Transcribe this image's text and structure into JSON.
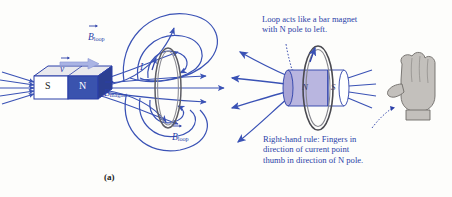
{
  "figure": {
    "background_color": "#fdfdfb",
    "ink_color": "#2b3fa8",
    "field_line_color": "#3a52b5",
    "caption_color": "#1a1a1a"
  },
  "panel_a": {
    "caption": "(a)",
    "magnet": {
      "south_label": "S",
      "north_label": "N",
      "south_face_color": "#ffffff",
      "north_face_color": "#3a53ae",
      "top_face_color": "#e9e9ee",
      "outline_color": "#2b3fa8"
    },
    "velocity": {
      "label": "v",
      "has_vector_arrow": true,
      "arrow_color": "#aab4e4",
      "direction": "right"
    },
    "field_labels": {
      "b_loop_top": {
        "base": "B",
        "subscript": "loop",
        "has_vector_arrow": true
      },
      "b_magnet": {
        "base": "B",
        "subscript": "magnet",
        "has_vector_arrow": true
      },
      "b_loop_bottom": {
        "base": "B",
        "subscript": "loop",
        "has_vector_arrow": true
      }
    },
    "current": {
      "label": "I",
      "arrow_direction": "up"
    },
    "loop": {
      "shape": "ellipse-edge-on",
      "wire_style": "double-line",
      "wire_color": "#6b6b70"
    }
  },
  "panel_b": {
    "caption": "(b)",
    "annotation_top": "Loop acts like a bar magnet\nwith N pole to left.",
    "annotation_bottom": "Right-hand rule: Fingers in\ndirection of current point\nthumb in direction of N pole.",
    "equivalent_magnet": {
      "north_label": "N",
      "south_label": "S",
      "north_face_color": "#b9b6e0",
      "south_face_color": "#ffffff",
      "outline_color": "#2b3fa8",
      "shape": "cylinder"
    },
    "current": {
      "label": "I",
      "arrow_direction": "up"
    },
    "hand": {
      "description": "right-hand-with-thumb-pointing-left",
      "fill_color": "#c3c0bc",
      "outline_color": "#6e6b68"
    },
    "loop": {
      "shape": "ring",
      "wire_color": "#4a4a50"
    }
  }
}
